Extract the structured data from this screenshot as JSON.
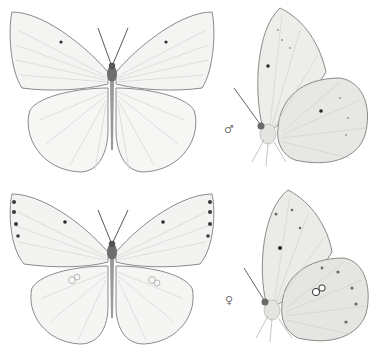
{
  "plate": {
    "figures": [
      {
        "id": "male-upperside",
        "sex": "male",
        "view": "upperside"
      },
      {
        "id": "male-underside",
        "sex": "male",
        "view": "underside",
        "label": "♂"
      },
      {
        "id": "female-upperside",
        "sex": "female",
        "view": "upperside"
      },
      {
        "id": "female-underside",
        "sex": "female",
        "view": "underside",
        "label": "♀"
      }
    ],
    "colors": {
      "wing_fill": "#f4f4f2",
      "wing_edge": "#8a8a8a",
      "vein": "#c8c8c8",
      "body": "#6e6e6e",
      "underside_fill": "#e9e9e6",
      "spot": "#2a2a2a"
    }
  }
}
